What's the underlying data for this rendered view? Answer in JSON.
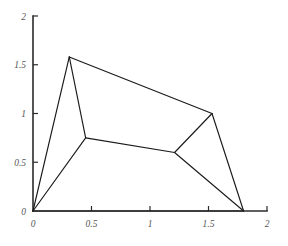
{
  "figure": {
    "title": "",
    "background_color": "#ffffff",
    "line_color": "#1a1a1a",
    "axis_color": "#2b2b2b",
    "label_color": "#555555"
  },
  "chart_data": {
    "type": "line",
    "title": "",
    "xlabel": "",
    "ylabel": "",
    "xlim": [
      0,
      2
    ],
    "ylim": [
      0,
      2
    ],
    "grid": false,
    "legend": null,
    "xticks": [
      0,
      0.5,
      1,
      1.5,
      2
    ],
    "xticklabels": [
      "0",
      "0.5",
      "1",
      "1.5",
      "2"
    ],
    "yticks": [
      0,
      0.5,
      1,
      1.5,
      2
    ],
    "yticklabels": [
      "0",
      "0.5",
      "1",
      "1.5",
      "2"
    ],
    "nodes": [
      {
        "id": "origin",
        "x": 0.0,
        "y": 0.0
      },
      {
        "id": "apex",
        "x": 0.31,
        "y": 1.58
      },
      {
        "id": "left-joint",
        "x": 0.45,
        "y": 0.75
      },
      {
        "id": "right-joint",
        "x": 1.21,
        "y": 0.6
      },
      {
        "id": "top-right",
        "x": 1.53,
        "y": 1.0
      },
      {
        "id": "bottom-right",
        "x": 1.8,
        "y": 0.0
      }
    ],
    "edges": [
      {
        "from": "origin",
        "to": "apex"
      },
      {
        "from": "origin",
        "to": "left-joint"
      },
      {
        "from": "origin",
        "to": "bottom-right"
      },
      {
        "from": "apex",
        "to": "left-joint"
      },
      {
        "from": "apex",
        "to": "top-right"
      },
      {
        "from": "left-joint",
        "to": "right-joint"
      },
      {
        "from": "right-joint",
        "to": "top-right"
      },
      {
        "from": "right-joint",
        "to": "bottom-right"
      },
      {
        "from": "top-right",
        "to": "bottom-right"
      }
    ],
    "series": [
      {
        "name": "mesh-outline",
        "x": [
          0.0,
          0.31,
          1.53,
          1.8,
          0.0
        ],
        "y": [
          0.0,
          1.58,
          1.0,
          0.0,
          0.0
        ]
      },
      {
        "name": "interior-chain",
        "x": [
          0.31,
          0.45,
          1.21,
          1.53
        ],
        "y": [
          1.58,
          0.75,
          0.6,
          1.0
        ]
      },
      {
        "name": "spoke-origin-left-joint",
        "x": [
          0.0,
          0.45
        ],
        "y": [
          0.0,
          0.75
        ]
      },
      {
        "name": "spoke-right-joint-bottom-right",
        "x": [
          1.21,
          1.8
        ],
        "y": [
          0.6,
          0.0
        ]
      }
    ]
  }
}
